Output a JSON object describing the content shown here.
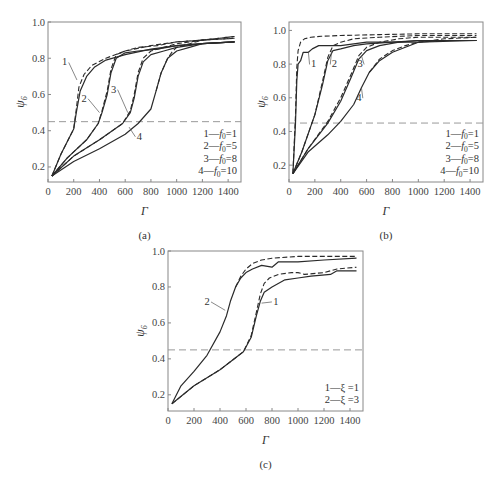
{
  "chart_data": [
    {
      "id": "a",
      "type": "line",
      "panel_label": "(a)",
      "title": "",
      "xlabel": "Γ",
      "ylabel": "ψ6",
      "xlim": [
        0,
        1500
      ],
      "ylim": [
        0.117,
        1.0
      ],
      "xticks": [
        0,
        200,
        400,
        600,
        800,
        1000,
        1200,
        1400
      ],
      "yticks": [
        0.2,
        0.4,
        0.6,
        0.8,
        1.0
      ],
      "grid": false,
      "threshold_line": {
        "y": 0.45,
        "style": "dashed"
      },
      "legend": {
        "position": "lower right",
        "entries": [
          "1—f0=1",
          "2—f0=5",
          "3—f0=8",
          "4—f0=10"
        ]
      },
      "series": [
        {
          "name": "1—f0=1 (solid)",
          "style": "solid",
          "x": [
            30,
            100,
            200,
            220,
            250,
            300,
            360,
            450,
            600,
            800,
            1000,
            1200,
            1450
          ],
          "y": [
            0.15,
            0.27,
            0.41,
            0.5,
            0.62,
            0.7,
            0.75,
            0.79,
            0.82,
            0.85,
            0.87,
            0.88,
            0.89
          ]
        },
        {
          "name": "1—f0=1 (dashed)",
          "style": "dashed",
          "x": [
            30,
            100,
            200,
            220,
            240,
            280,
            340,
            450,
            600,
            800,
            1000,
            1200,
            1450
          ],
          "y": [
            0.15,
            0.27,
            0.41,
            0.52,
            0.64,
            0.71,
            0.76,
            0.8,
            0.84,
            0.87,
            0.89,
            0.9,
            0.91
          ]
        },
        {
          "name": "2—f0=5 (solid)",
          "style": "solid",
          "x": [
            30,
            150,
            300,
            390,
            420,
            460,
            490,
            530,
            600,
            700,
            850,
            1000,
            1200,
            1450
          ],
          "y": [
            0.15,
            0.25,
            0.35,
            0.44,
            0.5,
            0.6,
            0.72,
            0.8,
            0.83,
            0.84,
            0.85,
            0.87,
            0.88,
            0.89
          ]
        },
        {
          "name": "2—f0=5 (dashed)",
          "style": "dashed",
          "x": [
            30,
            150,
            300,
            390,
            420,
            460,
            490,
            530,
            600,
            700,
            850,
            1000,
            1200,
            1450
          ],
          "y": [
            0.15,
            0.25,
            0.35,
            0.44,
            0.51,
            0.62,
            0.74,
            0.82,
            0.84,
            0.86,
            0.87,
            0.89,
            0.9,
            0.91
          ]
        },
        {
          "name": "3—f0=8 (solid)",
          "style": "solid",
          "x": [
            30,
            200,
            400,
            580,
            640,
            670,
            700,
            740,
            800,
            900,
            1000,
            1200,
            1450
          ],
          "y": [
            0.15,
            0.26,
            0.35,
            0.44,
            0.5,
            0.58,
            0.7,
            0.78,
            0.82,
            0.84,
            0.86,
            0.88,
            0.89
          ]
        },
        {
          "name": "3—f0=8 (dashed)",
          "style": "dashed",
          "x": [
            30,
            200,
            400,
            580,
            640,
            670,
            700,
            740,
            800,
            900,
            1000,
            1200,
            1450
          ],
          "y": [
            0.15,
            0.26,
            0.35,
            0.44,
            0.51,
            0.6,
            0.72,
            0.8,
            0.84,
            0.86,
            0.88,
            0.9,
            0.92
          ]
        },
        {
          "name": "4—f0=10 (solid)",
          "style": "solid",
          "x": [
            30,
            200,
            400,
            600,
            700,
            800,
            840,
            880,
            930,
            1000,
            1100,
            1200,
            1450
          ],
          "y": [
            0.15,
            0.23,
            0.3,
            0.38,
            0.44,
            0.52,
            0.62,
            0.72,
            0.8,
            0.84,
            0.86,
            0.88,
            0.89
          ]
        },
        {
          "name": "4—f0=10 (dashed)",
          "style": "dashed",
          "x": [
            840,
            880,
            930,
            970,
            1000,
            1100,
            1200,
            1450
          ],
          "y": [
            0.62,
            0.72,
            0.8,
            0.84,
            0.86,
            0.88,
            0.9,
            0.92
          ]
        }
      ],
      "annotations": [
        {
          "text": "1",
          "x": 130,
          "y": 0.76,
          "leader_to": [
            225,
            0.68
          ]
        },
        {
          "text": "2",
          "x": 280,
          "y": 0.56,
          "leader_to": [
            400,
            0.5
          ]
        },
        {
          "text": "3",
          "x": 510,
          "y": 0.61,
          "leader_to": [
            620,
            0.5
          ]
        },
        {
          "text": "4",
          "x": 710,
          "y": 0.35,
          "leader_to": [
            630,
            0.42
          ]
        }
      ]
    },
    {
      "id": "b",
      "type": "line",
      "panel_label": "(b)",
      "title": "",
      "xlabel": "Γ",
      "ylabel": "ψ6",
      "xlim": [
        0,
        1500
      ],
      "ylim": [
        0.1,
        1.05
      ],
      "xticks": [
        0,
        200,
        400,
        600,
        800,
        1000,
        1200,
        1400
      ],
      "yticks": [
        0.2,
        0.4,
        0.6,
        0.8,
        1.0
      ],
      "grid": false,
      "threshold_line": {
        "y": 0.45,
        "style": "dashed"
      },
      "legend": {
        "position": "lower right",
        "entries": [
          "1—f0=1",
          "2—f0=5",
          "3—f0=8",
          "4—f0=10"
        ]
      },
      "series": [
        {
          "name": "1—f0=1 (solid)",
          "style": "solid",
          "x": [
            30,
            50,
            60,
            70,
            90,
            110,
            150,
            180,
            230,
            400,
            600,
            1000,
            1450
          ],
          "y": [
            0.15,
            0.45,
            0.7,
            0.8,
            0.82,
            0.87,
            0.87,
            0.89,
            0.91,
            0.91,
            0.93,
            0.93,
            0.94
          ]
        },
        {
          "name": "1—f0=1 (dashed)",
          "style": "dashed",
          "x": [
            30,
            50,
            60,
            70,
            90,
            120,
            170,
            250,
            400,
            700,
            1000,
            1450
          ],
          "y": [
            0.15,
            0.5,
            0.78,
            0.88,
            0.93,
            0.95,
            0.96,
            0.965,
            0.97,
            0.975,
            0.98,
            0.98
          ]
        },
        {
          "name": "2—f0=5 (solid)",
          "style": "solid",
          "x": [
            30,
            100,
            200,
            260,
            300,
            340,
            400,
            500,
            600,
            800,
            1000,
            1450
          ],
          "y": [
            0.15,
            0.28,
            0.5,
            0.68,
            0.82,
            0.88,
            0.89,
            0.91,
            0.92,
            0.93,
            0.94,
            0.94
          ]
        },
        {
          "name": "2—f0=5 (dashed)",
          "style": "dashed",
          "x": [
            30,
            100,
            200,
            260,
            300,
            340,
            400,
            500,
            700,
            1000,
            1450
          ],
          "y": [
            0.15,
            0.28,
            0.5,
            0.7,
            0.84,
            0.91,
            0.93,
            0.95,
            0.96,
            0.97,
            0.97
          ]
        },
        {
          "name": "3—f0=8 (solid)",
          "style": "solid",
          "x": [
            30,
            150,
            300,
            400,
            480,
            540,
            600,
            700,
            850,
            1000,
            1450
          ],
          "y": [
            0.15,
            0.3,
            0.45,
            0.58,
            0.72,
            0.83,
            0.88,
            0.91,
            0.93,
            0.94,
            0.94
          ]
        },
        {
          "name": "3—f0=8 (dashed)",
          "style": "dashed",
          "x": [
            30,
            150,
            300,
            400,
            480,
            540,
            600,
            700,
            850,
            1000,
            1450
          ],
          "y": [
            0.15,
            0.3,
            0.46,
            0.6,
            0.74,
            0.85,
            0.9,
            0.93,
            0.95,
            0.96,
            0.96
          ]
        },
        {
          "name": "4—f0=10 (solid)",
          "style": "solid",
          "x": [
            30,
            150,
            300,
            400,
            500,
            560,
            620,
            700,
            800,
            900,
            1000,
            1200,
            1450
          ],
          "y": [
            0.15,
            0.28,
            0.38,
            0.46,
            0.56,
            0.66,
            0.75,
            0.82,
            0.87,
            0.9,
            0.93,
            0.94,
            0.94
          ]
        },
        {
          "name": "4—f0=10 (dashed)",
          "style": "dashed",
          "x": [
            620,
            700,
            800,
            900,
            1000,
            1200,
            1450
          ],
          "y": [
            0.75,
            0.83,
            0.88,
            0.91,
            0.93,
            0.95,
            0.96
          ]
        }
      ],
      "annotations": [
        {
          "text": "1",
          "x": 190,
          "y": 0.78,
          "leader_to": [
            150,
            0.87
          ]
        },
        {
          "text": "2",
          "x": 350,
          "y": 0.78,
          "leader_to": [
            330,
            0.88
          ]
        },
        {
          "text": "3",
          "x": 550,
          "y": 0.78,
          "leader_to": [
            560,
            0.85
          ]
        },
        {
          "text": "4",
          "x": 540,
          "y": 0.58,
          "leader_to": [
            560,
            0.66
          ]
        }
      ]
    },
    {
      "id": "c",
      "type": "line",
      "panel_label": "(c)",
      "title": "",
      "xlabel": "Γ",
      "ylabel": "ψ6",
      "xlim": [
        0,
        1500
      ],
      "ylim": [
        0.11,
        1.0
      ],
      "xticks": [
        0,
        200,
        400,
        600,
        800,
        1000,
        1200,
        1400
      ],
      "yticks": [
        0.2,
        0.4,
        0.6,
        0.8,
        1.0
      ],
      "grid": false,
      "threshold_line": {
        "y": 0.45,
        "style": "dashed"
      },
      "legend": {
        "position": "lower right",
        "entries": [
          "1—ξ=1",
          "2—ξ=3"
        ]
      },
      "series": [
        {
          "name": "1—ξ=1 (solid)",
          "style": "solid",
          "x": [
            30,
            200,
            400,
            580,
            640,
            680,
            710,
            740,
            800,
            900,
            1000,
            1100,
            1250,
            1300,
            1450
          ],
          "y": [
            0.15,
            0.25,
            0.34,
            0.44,
            0.52,
            0.64,
            0.72,
            0.77,
            0.8,
            0.84,
            0.85,
            0.86,
            0.87,
            0.89,
            0.89
          ]
        },
        {
          "name": "1—ξ=1 (dashed)",
          "style": "dashed",
          "x": [
            30,
            200,
            400,
            580,
            640,
            680,
            710,
            740,
            780,
            850,
            950,
            1000,
            1050,
            1200,
            1300,
            1450
          ],
          "y": [
            0.15,
            0.25,
            0.34,
            0.44,
            0.53,
            0.66,
            0.76,
            0.82,
            0.85,
            0.87,
            0.88,
            0.88,
            0.87,
            0.88,
            0.9,
            0.91
          ]
        },
        {
          "name": "2—ξ=3 (solid)",
          "style": "solid",
          "x": [
            30,
            100,
            200,
            300,
            400,
            450,
            480,
            520,
            560,
            600,
            650,
            720,
            800,
            850,
            1000,
            1200,
            1450
          ],
          "y": [
            0.15,
            0.25,
            0.33,
            0.42,
            0.55,
            0.64,
            0.72,
            0.8,
            0.85,
            0.88,
            0.9,
            0.92,
            0.91,
            0.94,
            0.94,
            0.95,
            0.96
          ]
        },
        {
          "name": "2—ξ=3 (dashed)",
          "style": "dashed",
          "x": [
            520,
            560,
            600,
            650,
            720,
            800,
            1000,
            1200,
            1450
          ],
          "y": [
            0.8,
            0.86,
            0.9,
            0.93,
            0.95,
            0.96,
            0.97,
            0.97,
            0.97
          ]
        }
      ],
      "annotations": [
        {
          "text": "2",
          "x": 300,
          "y": 0.7,
          "leader_to": [
            440,
            0.67
          ]
        },
        {
          "text": "1",
          "x": 830,
          "y": 0.7,
          "leader_to": [
            720,
            0.71
          ]
        }
      ]
    }
  ],
  "panels": {
    "a": {
      "label": "(a)",
      "xlabel": "Γ",
      "ylabel": "ψ",
      "ylabel_sub": "6",
      "legend": [
        {
          "num": "1",
          "sym": "f",
          "sub": "0",
          "val": "=1"
        },
        {
          "num": "2",
          "sym": "f",
          "sub": "0",
          "val": "=5"
        },
        {
          "num": "3",
          "sym": "f",
          "sub": "0",
          "val": "=8"
        },
        {
          "num": "4",
          "sym": "f",
          "sub": "0",
          "val": "=10"
        }
      ]
    },
    "b": {
      "label": "(b)",
      "xlabel": "Γ",
      "ylabel": "ψ",
      "ylabel_sub": "6",
      "legend": [
        {
          "num": "1",
          "sym": "f",
          "sub": "0",
          "val": "=1"
        },
        {
          "num": "2",
          "sym": "f",
          "sub": "0",
          "val": "=5"
        },
        {
          "num": "3",
          "sym": "f",
          "sub": "0",
          "val": "=8"
        },
        {
          "num": "4",
          "sym": "f",
          "sub": "0",
          "val": "=10"
        }
      ]
    },
    "c": {
      "label": "(c)",
      "xlabel": "Γ",
      "ylabel": "ψ",
      "ylabel_sub": "6",
      "legend": [
        {
          "num": "1",
          "sym": "ξ",
          "sub": "",
          "val": " =1"
        },
        {
          "num": "2",
          "sym": "ξ",
          "sub": "",
          "val": " =3"
        }
      ]
    }
  },
  "colors": {
    "line": "#2a2a2a",
    "frame": "#888888",
    "threshold": "#999999",
    "text": "#333333"
  }
}
